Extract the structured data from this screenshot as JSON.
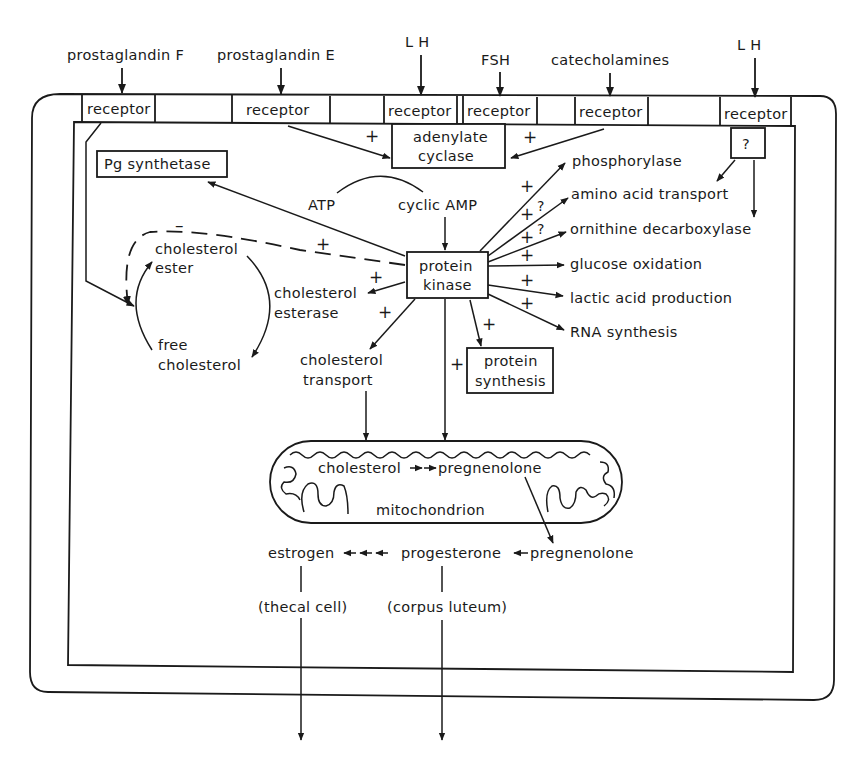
{
  "hormones": {
    "pgf": "prostaglandin F",
    "pge": "prostaglandin E",
    "lh1": "L H",
    "fsh": "FSH",
    "catecholamines": "catecholamines",
    "lh2": "L H"
  },
  "receptors": {
    "r1": "receptor",
    "r2": "receptor",
    "r3": "receptor",
    "r4": "receptor",
    "r5": "receptor",
    "r6": "receptor"
  },
  "enzymes": {
    "adenylate_1": "adenylate",
    "adenylate_2": "cyclase",
    "pg_synthetase": "Pg synthetase",
    "unknown": "?",
    "protein_kinase_1": "protein",
    "protein_kinase_2": "kinase",
    "protein_synthesis_1": "protein",
    "protein_synthesis_2": "synthesis"
  },
  "cofactors": {
    "atp": "ATP",
    "camp": "cyclic AMP"
  },
  "effects": [
    "phosphorylase",
    "amino acid transport",
    "ornithine decarboxylase",
    "glucose oxidation",
    "lactic acid production",
    "RNA synthesis"
  ],
  "cholesterol_cycle": {
    "ester_1": "cholesterol",
    "ester_2": "ester",
    "free_1": "free",
    "free_2": "cholesterol",
    "esterase_1": "cholesterol",
    "esterase_2": "esterase",
    "transport_1": "cholesterol",
    "transport_2": "transport"
  },
  "mitochondrion": {
    "label": "mitochondrion",
    "substrate": "cholesterol",
    "product": "pregnenolone"
  },
  "steroidogenesis": {
    "estrogen": "estrogen",
    "progesterone": "progesterone",
    "pregnenolone": "pregnenolone",
    "thecal": "(thecal cell)",
    "corpus": "(corpus luteum)"
  },
  "signs": {
    "plus": "+",
    "minus": "–",
    "question": "?"
  }
}
